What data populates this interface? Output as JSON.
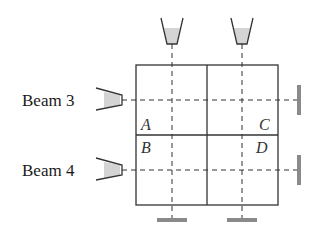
{
  "diagram": {
    "labels": {
      "beam3": "Beam 3",
      "beam4": "Beam 4"
    },
    "cells": {
      "a": "A",
      "b": "B",
      "c": "C",
      "d": "D"
    },
    "colors": {
      "line": "#333333",
      "emitter_fill": "#d4d4d4",
      "detector": "#8a8a8a"
    }
  }
}
